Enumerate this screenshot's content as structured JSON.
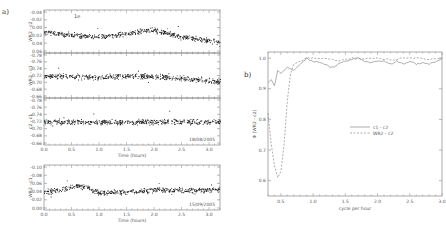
{
  "panel_labels": {
    "a": "a)",
    "b": "b)"
  },
  "chart_data": [
    {
      "type": "scatter",
      "panel": "a1",
      "ylabel": "WR2 - c2",
      "yticks": [
        "-0.04",
        "-0.02",
        "0.00",
        "0.02",
        "0.04",
        "0.06"
      ],
      "ylim": [
        0.06,
        -0.05
      ],
      "annotation": "1e",
      "xlim": [
        0,
        3.2
      ],
      "trend": [
        [
          0,
          0.005
        ],
        [
          0.5,
          -0.005
        ],
        [
          1,
          -0.01
        ],
        [
          1.5,
          0.0
        ],
        [
          2,
          0.01
        ],
        [
          2.5,
          -0.01
        ],
        [
          3,
          -0.02
        ],
        [
          3.2,
          -0.025
        ]
      ]
    },
    {
      "type": "scatter",
      "panel": "a2",
      "ylabel": "WR2 - c1",
      "yticks": [
        "-0.78",
        "-0.76",
        "-0.74",
        "-0.72",
        "-0.70",
        "-0.68",
        "-0.66"
      ],
      "ylim": [
        -0.66,
        -0.78
      ],
      "xlim": [
        0,
        3.2
      ],
      "trend": [
        [
          0,
          -0.72
        ],
        [
          0.5,
          -0.722
        ],
        [
          1,
          -0.725
        ],
        [
          1.5,
          -0.72
        ],
        [
          2,
          -0.722
        ],
        [
          2.5,
          -0.728
        ],
        [
          3,
          -0.735
        ],
        [
          3.2,
          -0.74
        ]
      ]
    },
    {
      "type": "scatter",
      "panel": "a3",
      "ylabel": "c2 - c1",
      "yticks": [
        "-0.78",
        "-0.76",
        "-0.74",
        "-0.72",
        "-0.70",
        "-0.68",
        "-0.66"
      ],
      "ylim": [
        -0.66,
        -0.78
      ],
      "annotation": "18/08/2005",
      "xlabel": "Time (hours)",
      "xticks": [
        "0.0",
        "0.5",
        "1.0",
        "1.5",
        "2.0",
        "2.5",
        "3.0"
      ],
      "xlim": [
        0,
        3.2
      ],
      "trend": [
        [
          0,
          -0.72
        ],
        [
          1,
          -0.722
        ],
        [
          2,
          -0.72
        ],
        [
          3,
          -0.72
        ]
      ]
    },
    {
      "type": "scatter",
      "panel": "a4",
      "ylabel": "WR2 - c1",
      "yticks": [
        "-0.10",
        "-0.08",
        "-0.06",
        "-0.04",
        "-0.02",
        "0.00"
      ],
      "ylim": [
        -0.1,
        0.0
      ],
      "annotation": "15/09/2005",
      "xlabel": "Time (hours)",
      "xticks": [
        "0.0",
        "0.5",
        "1.0",
        "1.5",
        "2.0",
        "2.5",
        "3.0"
      ],
      "xlim": [
        0,
        3.2
      ],
      "trend": [
        [
          0,
          -0.04
        ],
        [
          0.3,
          -0.045
        ],
        [
          0.6,
          -0.055
        ],
        [
          0.8,
          -0.05
        ],
        [
          1.0,
          -0.038
        ],
        [
          1.5,
          -0.04
        ],
        [
          2,
          -0.045
        ],
        [
          2.5,
          -0.042
        ],
        [
          3,
          -0.045
        ],
        [
          3.2,
          -0.045
        ]
      ]
    },
    {
      "type": "line",
      "panel": "b",
      "xlabel": "cycle per hour",
      "ylabel": "Φ (WR2 - c2)",
      "xticks": [
        "0.5",
        "1.0",
        "1.5",
        "2.0",
        "2.5",
        "3.0"
      ],
      "yticks": [
        "0.6",
        "0.7",
        "0.8",
        "0.9",
        "1.0"
      ],
      "xlim": [
        0.3,
        3.0
      ],
      "ylim": [
        0.55,
        1.02
      ],
      "legend": [
        {
          "label": "c1 - c2",
          "style": "solid"
        },
        {
          "label": "WR2 - c2",
          "style": "dashed"
        }
      ],
      "series": [
        {
          "name": "c1 - c2",
          "x": [
            0.3,
            0.35,
            0.4,
            0.45,
            0.5,
            0.6,
            0.7,
            0.8,
            0.9,
            1.0,
            1.1,
            1.2,
            1.3,
            1.4,
            1.5,
            1.6,
            1.7,
            1.8,
            1.9,
            2.0,
            2.1,
            2.2,
            2.3,
            2.4,
            2.5,
            2.6,
            2.7,
            2.8,
            2.9,
            3.0
          ],
          "values": [
            0.92,
            0.93,
            0.91,
            0.96,
            0.95,
            0.97,
            0.96,
            0.98,
            1.0,
            0.99,
            0.985,
            0.98,
            0.97,
            0.98,
            0.99,
            0.995,
            1.0,
            0.99,
            0.985,
            0.99,
            0.99,
            0.98,
            0.99,
            0.98,
            0.99,
            0.98,
            0.985,
            0.98,
            0.99,
            1.0
          ]
        },
        {
          "name": "WR2 - c2",
          "x": [
            0.3,
            0.35,
            0.4,
            0.45,
            0.5,
            0.55,
            0.6,
            0.65,
            0.7,
            0.8,
            0.9,
            1.0,
            1.2,
            1.4,
            1.6,
            1.8,
            2.0,
            2.2,
            2.4,
            2.6,
            2.8,
            3.0
          ],
          "values": [
            0.82,
            0.72,
            0.65,
            0.61,
            0.63,
            0.72,
            0.86,
            0.95,
            0.98,
            0.99,
            1.0,
            1.0,
            1.0,
            0.99,
            1.0,
            1.0,
            1.0,
            0.995,
            1.0,
            1.0,
            0.995,
            1.0
          ]
        }
      ]
    }
  ]
}
